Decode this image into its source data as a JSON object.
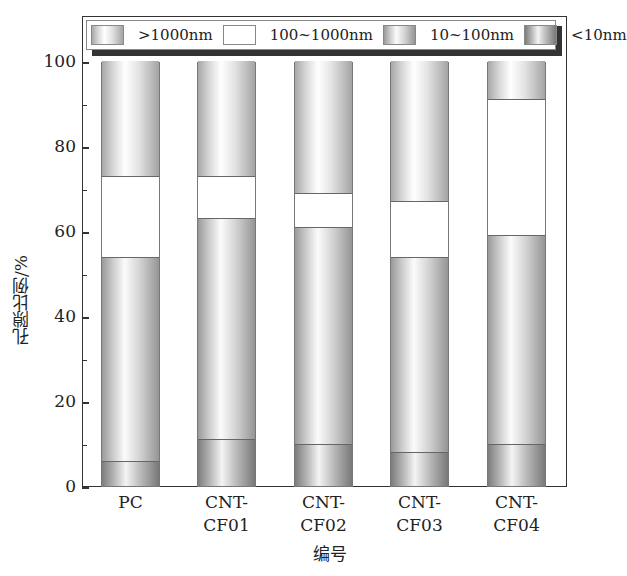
{
  "chart_data": {
    "type": "bar",
    "stacked": true,
    "title": "",
    "xlabel": "编号",
    "ylabel": "孔隙比例/%",
    "ylim": [
      0,
      100
    ],
    "yticks": [
      0,
      20,
      40,
      60,
      80,
      100
    ],
    "categories": [
      "PC",
      "CNT-CF01",
      "CNT-CF02",
      "CNT-CF03",
      "CNT-CF04"
    ],
    "category_lines": [
      [
        "PC"
      ],
      [
        "CNT-",
        "CF01"
      ],
      [
        "CNT-",
        "CF02"
      ],
      [
        "CNT-",
        "CF03"
      ],
      [
        "CNT-",
        "CF04"
      ]
    ],
    "series": [
      {
        "name": "<10nm",
        "values": [
          6,
          11,
          10,
          8,
          10
        ]
      },
      {
        "name": "10~100nm",
        "values": [
          48,
          52,
          51,
          46,
          49
        ]
      },
      {
        "name": "100~1000nm",
        "values": [
          19,
          10,
          8,
          13,
          32
        ]
      },
      {
        "name": ">1000nm",
        "values": [
          27,
          27,
          31,
          33,
          9
        ]
      }
    ],
    "cumulative_boundaries": {
      "PC": [
        6,
        54,
        73,
        100
      ],
      "CNT-CF01": [
        11,
        63,
        73,
        100
      ],
      "CNT-CF02": [
        10,
        61,
        69,
        100
      ],
      "CNT-CF03": [
        8,
        54,
        67,
        100
      ],
      "CNT-CF04": [
        10,
        59,
        91,
        100
      ]
    },
    "legend": {
      "position": "top",
      "entries": [
        ">1000nm",
        "100~1000nm",
        "10~100nm",
        "<10nm"
      ]
    },
    "grid": false
  }
}
